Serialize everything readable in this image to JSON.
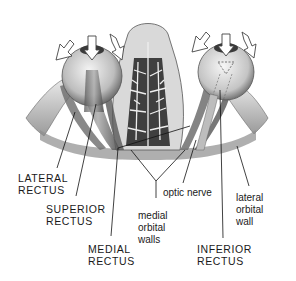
{
  "diagram": {
    "labels": {
      "lateral_rectus": {
        "line1": "LATERAL",
        "line2": "RECTUS"
      },
      "superior_rectus": {
        "line1": "SUPERIOR",
        "line2": "RECTUS"
      },
      "medial_rectus": {
        "line1": "MEDIAL",
        "line2": "RECTUS"
      },
      "medial_orbital_walls": {
        "line1": "medial",
        "line2": "orbital",
        "line3": "walls"
      },
      "optic_nerve": {
        "line1": "optic nerve"
      },
      "lateral_orbital_wall": {
        "line1": "lateral",
        "line2": "orbital",
        "line3": "wall"
      },
      "inferior_rectus": {
        "line1": "INFERIOR",
        "line2": "RECTUS"
      }
    },
    "colors": {
      "ink": "#1a1a1a",
      "shade": "#8a8a8a",
      "light": "#e6e6e6",
      "background": "#ffffff"
    }
  }
}
